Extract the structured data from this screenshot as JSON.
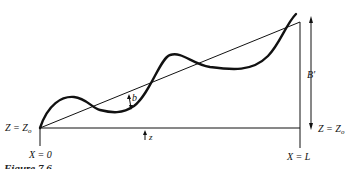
{
  "diagram": {
    "type": "wavy-bed-profile",
    "labels": {
      "left_datum": "Z = Z",
      "left_datum_sub": "o",
      "right_datum": "Z = Z",
      "right_datum_sub": "o",
      "x_left": "X = 0",
      "x_right": "X = L",
      "amplitude": "b",
      "height": "B′",
      "vertical": "z"
    },
    "caption": "Figure 7.6",
    "colors": {
      "stroke": "#111111",
      "background": "#ffffff"
    }
  }
}
